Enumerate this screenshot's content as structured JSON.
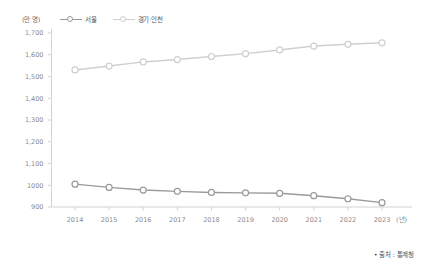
{
  "chart_data": {
    "type": "line",
    "title": "",
    "subtitle": "",
    "xlabel": "(년)",
    "ylabel": "(만 명)",
    "unit_label": "(만 명)",
    "x_unit_label": "(년)",
    "categories": [
      "2014",
      "2015",
      "2016",
      "2017",
      "2018",
      "2019",
      "2020",
      "2021",
      "2022",
      "2023"
    ],
    "x_tick_labels": [
      "2014",
      "2015",
      "2016",
      "2017",
      "2018",
      "2019",
      "2020",
      "2021",
      "2022",
      "2023"
    ],
    "y_tick_labels": [
      "1,700",
      "1,600",
      "1,500",
      "1,400",
      "1,300",
      "1,200",
      "1,100",
      "1000",
      "900"
    ],
    "y_tick_values": [
      1700,
      1600,
      1500,
      1400,
      1300,
      1200,
      1100,
      1000,
      900
    ],
    "ylim": [
      900,
      1700
    ],
    "grid": false,
    "legend_position": "top-left",
    "series": [
      {
        "name": "서울",
        "color": "#9a9a9a",
        "marker": "open-circle",
        "values": [
          1005,
          990,
          978,
          972,
          967,
          965,
          963,
          952,
          938,
          920
        ]
      },
      {
        "name": "경기·인천",
        "color": "#cfcfcf",
        "marker": "open-circle",
        "values": [
          1530,
          1548,
          1567,
          1578,
          1592,
          1605,
          1622,
          1640,
          1648,
          1655
        ]
      }
    ],
    "annotations": [
      "• 출처 : 통계청"
    ]
  },
  "legend": {
    "items": [
      {
        "label": "서울",
        "color": "#9a9a9a"
      },
      {
        "label": "경기·인천",
        "color": "#cfcfcf"
      }
    ]
  },
  "footer": {
    "source_note": "• 출처 : 통계청"
  },
  "colors": {
    "seoul": "#9a9a9a",
    "gyeonggi_incheon": "#cfcfcf",
    "axis": "#d2d2d2",
    "tick_text": "#8a8a8a",
    "background": "#ffffff"
  }
}
